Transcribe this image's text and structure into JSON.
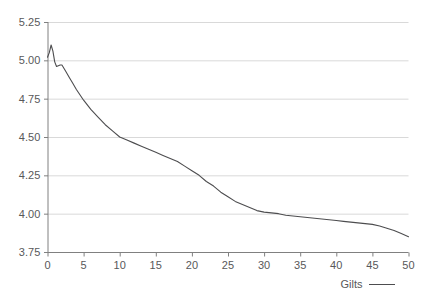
{
  "chart_data": {
    "type": "line",
    "title": "",
    "subtitle": "",
    "xlabel": "",
    "ylabel": "",
    "xlim": [
      0,
      50
    ],
    "ylim": [
      3.75,
      5.25
    ],
    "grid": "horizontal",
    "legend_position": "bottom-right",
    "line_color": "#4d4d4f",
    "grid_color": "#d9d9d9",
    "axis_color": "#808080",
    "text_color": "#58585a",
    "background_color": "#ffffff",
    "x_ticks": [
      0,
      5,
      10,
      15,
      20,
      25,
      30,
      35,
      40,
      45,
      50
    ],
    "x_tick_labels": [
      "0",
      "5",
      "10",
      "15",
      "20",
      "25",
      "30",
      "35",
      "40",
      "45",
      "50"
    ],
    "y_ticks": [
      3.75,
      4.0,
      4.25,
      4.5,
      4.75,
      5.0,
      5.25
    ],
    "y_tick_labels": [
      "3.75",
      "4.00",
      "4.25",
      "4.50",
      "4.75",
      "5.00",
      "5.25"
    ],
    "series": [
      {
        "name": "Gilts",
        "color": "#4d4d4f",
        "x": [
          0,
          0.25,
          0.5,
          0.75,
          1,
          1.25,
          1.5,
          1.75,
          2,
          2.5,
          3,
          3.5,
          4,
          5,
          6,
          7,
          8,
          9,
          10,
          11,
          12,
          13,
          14,
          15,
          16,
          17,
          18,
          19,
          20,
          21,
          22,
          23,
          24,
          25,
          26,
          27,
          28,
          29,
          30,
          31,
          32,
          33,
          34,
          35,
          36,
          37,
          38,
          39,
          40,
          41,
          42,
          43,
          44,
          45,
          46,
          47,
          48,
          49,
          50
        ],
        "y": [
          5.02,
          5.05,
          5.1,
          5.06,
          4.99,
          4.96,
          4.965,
          4.97,
          4.97,
          4.93,
          4.89,
          4.85,
          4.81,
          4.74,
          4.68,
          4.63,
          4.58,
          4.54,
          4.5,
          4.48,
          4.46,
          4.44,
          4.42,
          4.4,
          4.38,
          4.36,
          4.34,
          4.31,
          4.28,
          4.25,
          4.21,
          4.18,
          4.14,
          4.11,
          4.08,
          4.06,
          4.04,
          4.02,
          4.01,
          4.005,
          4.0,
          3.99,
          3.985,
          3.98,
          3.975,
          3.97,
          3.965,
          3.96,
          3.955,
          3.95,
          3.945,
          3.94,
          3.935,
          3.93,
          3.92,
          3.905,
          3.89,
          3.87,
          3.85
        ]
      }
    ],
    "legend": [
      {
        "label": "Gilts",
        "color": "#4d4d4f",
        "marker": "line"
      }
    ]
  },
  "legend": {
    "label": "Gilts"
  }
}
